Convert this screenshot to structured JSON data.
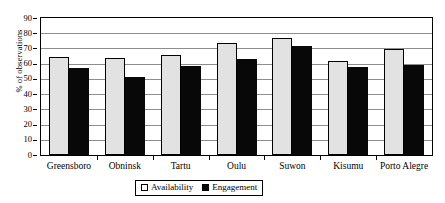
{
  "chart_data": {
    "type": "bar",
    "title": "",
    "xlabel": "",
    "ylabel": "% of observations",
    "ylim": [
      0,
      90
    ],
    "yticks": [
      0,
      10,
      20,
      30,
      40,
      50,
      60,
      70,
      80,
      90
    ],
    "grid": true,
    "legend_position": "bottom-center",
    "categories": [
      "Greensboro",
      "Obninsk",
      "Tartu",
      "Oulu",
      "Suwon",
      "Kisumu",
      "Porto Alegre"
    ],
    "series": [
      {
        "name": "Availability",
        "color": "#e2e2e2",
        "values": [
          64.2,
          63.8,
          65.6,
          73.5,
          77.2,
          62.1,
          69.6
        ]
      },
      {
        "name": "Engagement",
        "color": "#080808",
        "values": [
          57.4,
          51.1,
          58.6,
          63.4,
          71.6,
          57.7,
          59.0
        ]
      }
    ]
  },
  "axis": {
    "y_title": "% of observations"
  },
  "legend": {
    "items": [
      {
        "label": "Availability",
        "swatch": "availability-swatch"
      },
      {
        "label": "Engagement",
        "swatch": "engagement-swatch"
      }
    ]
  }
}
